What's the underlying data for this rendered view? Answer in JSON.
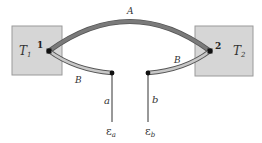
{
  "diagram": {
    "type": "thermocouple",
    "reservoirs": [
      {
        "label": "T",
        "subscript": "1",
        "junction": "1"
      },
      {
        "label": "T",
        "subscript": "2",
        "junction": "2"
      }
    ],
    "wires": {
      "top": "A",
      "left_lower": "B",
      "right_lower": "B",
      "left_lead": "a",
      "right_lead": "b"
    },
    "terminals": [
      {
        "label": "ε",
        "subscript": "a"
      },
      {
        "label": "ε",
        "subscript": "b"
      }
    ]
  },
  "colors": {
    "box_fill": "#d6d6d6",
    "box_stroke": "#9a9a9a",
    "wire_a": "#7a7a7a",
    "wire_b": "#c4c4c4",
    "wire_outline": "#555555"
  }
}
